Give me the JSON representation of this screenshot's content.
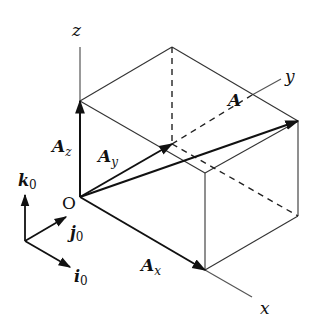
{
  "diagram": {
    "colors": {
      "line": "#222222",
      "axis": "#555555",
      "background": "#ffffff"
    },
    "axes": {
      "x": {
        "label": "x"
      },
      "y": {
        "label": "y"
      },
      "z": {
        "label": "z"
      }
    },
    "origin": {
      "label": "O"
    },
    "vectors": {
      "A": {
        "base": "A",
        "sub": ""
      },
      "Ax": {
        "base": "A",
        "sub": "x"
      },
      "Ay": {
        "base": "A",
        "sub": "y"
      },
      "Az": {
        "base": "A",
        "sub": "z"
      }
    },
    "basis": {
      "i": {
        "base": "i",
        "sub": "0"
      },
      "j": {
        "base": "j",
        "sub": "0"
      },
      "k": {
        "base": "k",
        "sub": "0"
      }
    }
  }
}
